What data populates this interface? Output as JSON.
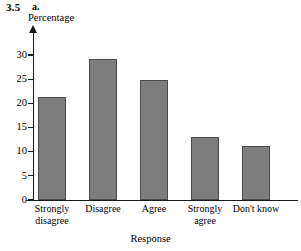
{
  "figure": {
    "number": "3.5",
    "part": "a."
  },
  "chart_data": {
    "type": "bar",
    "title": "",
    "xlabel": "Response",
    "ylabel": "Percentage",
    "categories": [
      "Strongly disagree",
      "Disagree",
      "Agree",
      "Strongly agree",
      "Don't know"
    ],
    "category_lines": [
      [
        "Strongly",
        "disagree"
      ],
      [
        "Disagree",
        ""
      ],
      [
        "Agree",
        ""
      ],
      [
        "Strongly",
        "agree"
      ],
      [
        "Don't know",
        ""
      ]
    ],
    "values": [
      21.3,
      29.2,
      24.8,
      13.0,
      11.1
    ],
    "ylim": [
      0,
      30
    ],
    "ytick_labels": [
      "30",
      "25",
      "20",
      "15",
      "10",
      "5",
      "0"
    ],
    "ytick_values": [
      30,
      25,
      20,
      15,
      10,
      5,
      0
    ],
    "grid": false,
    "legend": false,
    "bar_color": "#7d7d7d",
    "bar_border_color": "#4a4a4a",
    "axis_color": "#1a1a1a"
  }
}
